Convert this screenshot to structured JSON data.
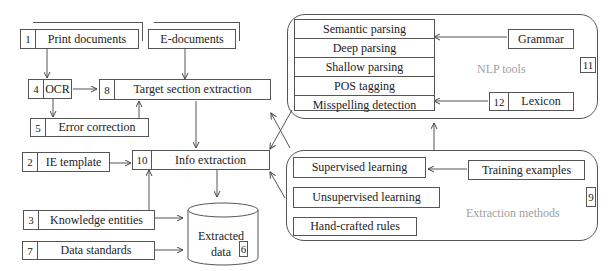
{
  "left_flow": {
    "print_documents": {
      "num": "1",
      "label": "Print documents"
    },
    "e_documents": {
      "label": "E-documents"
    },
    "ocr": {
      "num": "4",
      "label": "OCR"
    },
    "target_section": {
      "num": "8",
      "label": "Target section extraction"
    },
    "error_correction": {
      "num": "5",
      "label": "Error correction"
    },
    "ie_template": {
      "num": "2",
      "label": "IE template"
    },
    "info_extraction": {
      "num": "10",
      "label": "Info extraction"
    },
    "knowledge_entities": {
      "num": "3",
      "label": "Knowledge entities"
    },
    "data_standards": {
      "num": "7",
      "label": "Data standards"
    },
    "extracted_data": {
      "line1": "Extracted",
      "line2": "data",
      "num": "6"
    }
  },
  "nlp_tools": {
    "label": "NLP tools",
    "num": "11",
    "stack": [
      "Semantic parsing",
      "Deep parsing",
      "Shallow parsing",
      "POS tagging",
      "Misspelling detection"
    ],
    "grammar": "Grammar",
    "lexicon": {
      "num": "12",
      "label": "Lexicon"
    }
  },
  "extraction_methods": {
    "label": "Extraction methods",
    "num": "9",
    "items": [
      "Supervised learning",
      "Unsupervised learning",
      "Hand-crafted rules"
    ],
    "training_examples": "Training examples"
  }
}
